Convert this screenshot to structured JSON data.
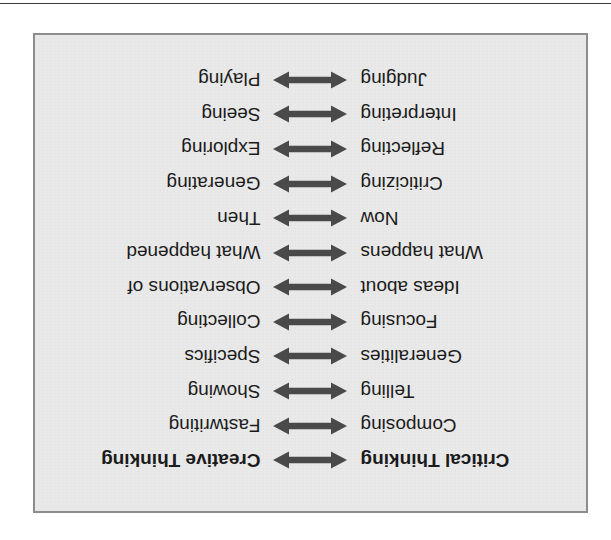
{
  "page": {
    "top_rule_color": "#3a3a3a",
    "frame_background": "#e9e9e9",
    "frame_border_color": "#8d8d8d",
    "text_color": "#1b1b1b",
    "arrow_color": "#4a4a4a",
    "orientation_note": "figure rendered rotated 180 degrees (upside down)"
  },
  "figure": {
    "arrow_icon": "double-headed-arrow-icon",
    "left_column_heading": "Critical Thinking",
    "right_column_heading": "Creative Thinking",
    "rows": [
      {
        "left": "Critical Thinking",
        "right": "Creative Thinking",
        "bold": true
      },
      {
        "left": "Composing",
        "right": "Fastwriting",
        "bold": false
      },
      {
        "left": "Telling",
        "right": "Showing",
        "bold": false
      },
      {
        "left": "Generalities",
        "right": "Specifics",
        "bold": false
      },
      {
        "left": "Focusing",
        "right": "Collecting",
        "bold": false
      },
      {
        "left": "Ideas about",
        "right": "Observations of",
        "bold": false
      },
      {
        "left": "What happens",
        "right": "What happened",
        "bold": false
      },
      {
        "left": "Now",
        "right": "Then",
        "bold": false
      },
      {
        "left": "Criticizing",
        "right": "Generating",
        "bold": false
      },
      {
        "left": "Reflecting",
        "right": "Exploring",
        "bold": false
      },
      {
        "left": "Interpreting",
        "right": "Seeing",
        "bold": false
      },
      {
        "left": "Judging",
        "right": "Playing",
        "bold": false
      }
    ]
  }
}
